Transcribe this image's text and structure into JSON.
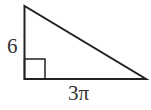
{
  "diagram": {
    "type": "right-triangle",
    "stroke_color": "#222222",
    "labels": {
      "vertical_leg": "6",
      "horizontal_leg": "3π"
    },
    "right_angle_marker": true
  }
}
